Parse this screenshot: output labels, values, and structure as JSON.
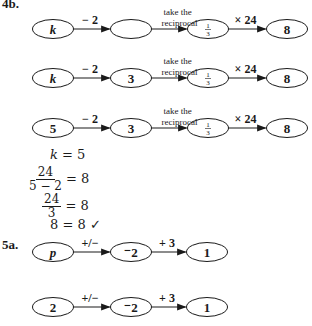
{
  "problem_4b": {
    "label": "4b.",
    "rows": [
      {
        "nodes": [
          "k",
          "",
          "1/3",
          "8"
        ],
        "ops": [
          "− 2",
          "take the reciprocal",
          "× 24"
        ],
        "italic": [
          true,
          false,
          false,
          false
        ]
      },
      {
        "nodes": [
          "k",
          "3",
          "1/3",
          "8"
        ],
        "ops": [
          "− 2",
          "take the reciprocal",
          "× 24"
        ],
        "italic": [
          true,
          false,
          false,
          false
        ]
      },
      {
        "nodes": [
          "5",
          "3",
          "1/3",
          "8"
        ],
        "ops": [
          "− 2",
          "take the reciprocal",
          "× 24"
        ],
        "italic": [
          false,
          false,
          false,
          false
        ]
      }
    ],
    "check": {
      "line1": {
        "lhs": "k",
        "rhs": "= 5"
      },
      "line2": {
        "num": "24",
        "den": "5 − 2",
        "rhs": "= 8"
      },
      "line3": {
        "num": "24",
        "den": "3",
        "rhs": "= 8"
      },
      "line4": {
        "text": "8 = 8 ✓"
      }
    }
  },
  "problem_5a": {
    "label": "5a.",
    "rows": [
      {
        "nodes": [
          "p",
          "⁻2",
          "1"
        ],
        "ops": [
          "+/−",
          "+ 3"
        ],
        "italic": [
          true,
          false,
          false
        ]
      },
      {
        "nodes": [
          "2",
          "⁻2",
          "1"
        ],
        "ops": [
          "+/−",
          "+ 3"
        ],
        "italic": [
          false,
          false,
          false
        ]
      }
    ]
  }
}
